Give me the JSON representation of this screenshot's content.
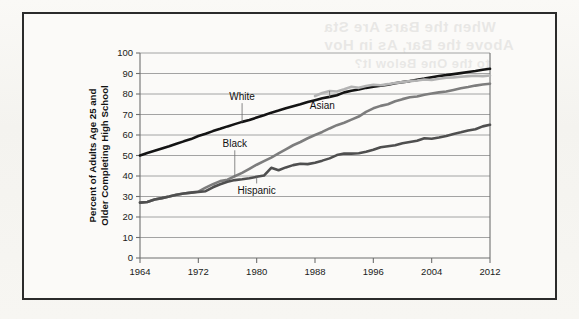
{
  "figure": {
    "background_color": "#f7f6f3",
    "frame_color": "#2b2b2b"
  },
  "bleed_through_text": [
    "When the Bars Are Sta",
    "Above the Bar, As in Hov",
    "to the One Below It?"
  ],
  "chart_data": {
    "type": "line",
    "title": "",
    "subtitle": "",
    "xlabel": "",
    "ylabel": "Percent of Adults Age 25 and Older Completing High School",
    "xlim": [
      1964,
      2012
    ],
    "ylim": [
      0,
      100
    ],
    "ytick_step": 10,
    "yticks": [
      0,
      10,
      20,
      30,
      40,
      50,
      60,
      70,
      80,
      90,
      100
    ],
    "xticks": [
      1964,
      1972,
      1980,
      1988,
      1996,
      2004,
      2012
    ],
    "grid": "horizontal",
    "legend": "inline-labels",
    "series": [
      {
        "name": "White",
        "color": "#141414",
        "width": 2.6,
        "label_position": {
          "x": 1978,
          "y": 77
        },
        "x": [
          1964,
          1965,
          1966,
          1967,
          1968,
          1969,
          1970,
          1971,
          1972,
          1973,
          1974,
          1975,
          1976,
          1977,
          1978,
          1979,
          1980,
          1981,
          1982,
          1983,
          1984,
          1985,
          1986,
          1987,
          1988,
          1989,
          1990,
          1991,
          1992,
          1993,
          1994,
          1995,
          1996,
          1997,
          1998,
          1999,
          2000,
          2001,
          2002,
          2003,
          2004,
          2005,
          2006,
          2007,
          2008,
          2009,
          2010,
          2011,
          2012
        ],
        "values": [
          50.0,
          51.2,
          52.3,
          53.4,
          54.5,
          55.7,
          56.9,
          58.0,
          59.5,
          60.6,
          61.9,
          63.0,
          64.2,
          65.3,
          66.4,
          67.3,
          68.5,
          69.6,
          70.9,
          71.9,
          73.0,
          74.0,
          75.0,
          76.1,
          77.0,
          77.9,
          78.6,
          79.4,
          80.8,
          81.6,
          82.2,
          83.0,
          83.6,
          84.0,
          84.5,
          85.2,
          85.8,
          86.3,
          86.9,
          87.5,
          88.2,
          88.8,
          89.2,
          89.7,
          90.2,
          90.7,
          91.2,
          91.8,
          92.3
        ]
      },
      {
        "name": "Asian",
        "color": "#b3b3b3",
        "width": 2.6,
        "label_position": {
          "x": 1990,
          "y": 73
        },
        "x": [
          1988,
          1989,
          1990,
          1991,
          1992,
          1993,
          1994,
          1995,
          1996,
          1997,
          1998,
          1999,
          2000,
          2001,
          2002,
          2003,
          2004,
          2005,
          2006,
          2007,
          2008,
          2009,
          2010,
          2011,
          2012
        ],
        "values": [
          79.0,
          80.5,
          81.5,
          81.2,
          82.3,
          83.5,
          83.0,
          83.9,
          84.5,
          84.3,
          84.8,
          85.4,
          85.8,
          86.3,
          86.6,
          87.1,
          86.8,
          87.4,
          87.9,
          88.1,
          88.4,
          88.7,
          88.9,
          88.7,
          89.0
        ]
      },
      {
        "name": "Black",
        "color": "#7d7d7d",
        "width": 2.6,
        "label_position": {
          "x": 1977,
          "y": 54
        },
        "x": [
          1964,
          1965,
          1966,
          1967,
          1968,
          1969,
          1970,
          1971,
          1972,
          1973,
          1974,
          1975,
          1976,
          1977,
          1978,
          1979,
          1980,
          1981,
          1982,
          1983,
          1984,
          1985,
          1986,
          1987,
          1988,
          1989,
          1990,
          1991,
          1992,
          1993,
          1994,
          1995,
          1996,
          1997,
          1998,
          1999,
          2000,
          2001,
          2002,
          2003,
          2004,
          2005,
          2006,
          2007,
          2008,
          2009,
          2010,
          2011,
          2012
        ],
        "values": [
          27.0,
          27.3,
          28.5,
          29.2,
          30.0,
          30.9,
          31.5,
          31.9,
          32.4,
          34.3,
          36.0,
          37.5,
          38.2,
          39.9,
          41.5,
          43.5,
          45.5,
          47.3,
          49.0,
          51.0,
          53.0,
          55.0,
          56.6,
          58.4,
          60.0,
          61.5,
          63.2,
          64.8,
          66.0,
          67.5,
          69.0,
          71.3,
          73.0,
          74.2,
          75.0,
          76.5,
          77.5,
          78.4,
          78.8,
          79.6,
          80.2,
          80.8,
          81.2,
          82.0,
          82.8,
          83.4,
          84.1,
          84.6,
          85.0
        ]
      },
      {
        "name": "Hispanic",
        "color": "#4f4f4f",
        "width": 2.6,
        "label_position": {
          "x": 1980,
          "y": 31
        },
        "x": [
          1964,
          1965,
          1966,
          1967,
          1968,
          1969,
          1970,
          1971,
          1972,
          1973,
          1974,
          1975,
          1976,
          1977,
          1978,
          1979,
          1980,
          1981,
          1982,
          1983,
          1984,
          1985,
          1986,
          1987,
          1988,
          1989,
          1990,
          1991,
          1992,
          1993,
          1994,
          1995,
          1996,
          1997,
          1998,
          1999,
          2000,
          2001,
          2002,
          2003,
          2004,
          2005,
          2006,
          2007,
          2008,
          2009,
          2010,
          2011,
          2012
        ],
        "values": [
          27.0,
          27.3,
          28.5,
          29.2,
          30.0,
          30.9,
          31.5,
          31.9,
          32.2,
          32.6,
          34.5,
          36.0,
          37.2,
          38.0,
          38.4,
          38.9,
          39.6,
          40.2,
          44.0,
          42.8,
          44.2,
          45.3,
          46.0,
          45.8,
          46.5,
          47.5,
          48.6,
          50.2,
          51.0,
          50.9,
          51.1,
          51.8,
          52.8,
          54.0,
          54.5,
          55.0,
          56.0,
          56.6,
          57.2,
          58.4,
          58.2,
          58.8,
          59.5,
          60.5,
          61.3,
          62.2,
          62.8,
          64.2,
          65.0
        ]
      }
    ]
  }
}
